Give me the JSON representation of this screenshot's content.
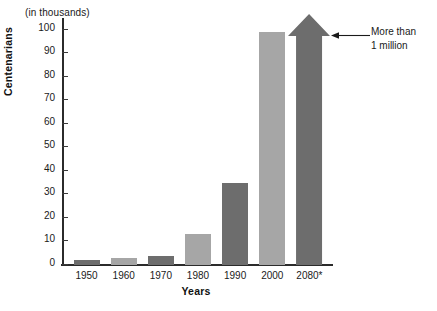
{
  "chart_data": {
    "type": "bar",
    "title": "",
    "subtitle": "",
    "unit_note": "(in thousands)",
    "xlabel": "Years",
    "ylabel": "Centenarians",
    "categories": [
      "1950",
      "1960",
      "1970",
      "1980",
      "1990",
      "2000",
      "2080*"
    ],
    "values": [
      2,
      3,
      4,
      13,
      35,
      99,
      100
    ],
    "ylim": [
      0,
      105
    ],
    "yticks": [
      0,
      10,
      20,
      30,
      40,
      50,
      60,
      70,
      80,
      90,
      100
    ],
    "ytick_labels": [
      "0",
      "10",
      "20",
      "30",
      "40",
      "50",
      "60",
      "70",
      "80",
      "90",
      "100"
    ],
    "grid": false,
    "legend": false,
    "bar_colors": [
      "#6d6d6d",
      "#a6a6a6",
      "#6d6d6d",
      "#a6a6a6",
      "#6d6d6d",
      "#a6a6a6",
      "#6d6d6d"
    ],
    "annotations": [
      {
        "text_line1": "More than",
        "text_line2": "1 million",
        "target_category": "2080*",
        "style": "arrow-left"
      }
    ]
  },
  "axis": {
    "unit_note": "(in thousands)",
    "y_title": "Centenarians",
    "x_title": "Years"
  },
  "annotation": {
    "line1": "More than",
    "line2": "1 million"
  },
  "colors": {
    "bar_dark": "#6d6d6d",
    "bar_light": "#a6a6a6",
    "axis": "#2b2b2b",
    "text": "#1a1a1a",
    "background": "#ffffff"
  }
}
